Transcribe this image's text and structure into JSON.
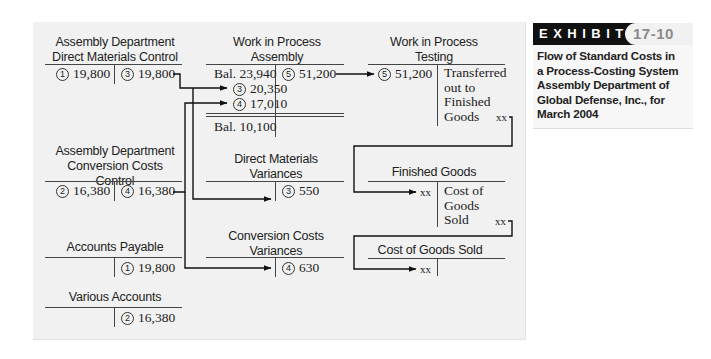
{
  "exhibit": {
    "label": "EXHIBIT",
    "number": "17-10",
    "caption": "Flow of Standard Costs in a Process-Costing System Assembly Department of Global Defense, Inc., for March 2004",
    "caption_lines": [
      "Flow of Standard Costs in",
      "a Process-Costing System",
      "Assembly Department of",
      "Global Defense, Inc., for",
      "March 2004"
    ]
  },
  "accounts": {
    "dm_control": {
      "title_lines": [
        "Assembly Department",
        "Direct Materials Control"
      ],
      "debit": {
        "marker": "1",
        "amount": "19,800"
      },
      "credit": {
        "marker": "3",
        "amount": "19,800"
      }
    },
    "cc_control": {
      "title_lines": [
        "Assembly Department",
        "Conversion Costs",
        "Control"
      ],
      "debit": {
        "marker": "2",
        "amount": "16,380"
      },
      "credit": {
        "marker": "4",
        "amount": "16,380"
      }
    },
    "accounts_payable": {
      "title": "Accounts Payable",
      "credit": {
        "marker": "1",
        "amount": "19,800"
      }
    },
    "various_accounts": {
      "title": "Various Accounts",
      "credit": {
        "marker": "2",
        "amount": "16,380"
      }
    },
    "wip_assembly": {
      "title_lines": [
        "Work in Process",
        "Assembly"
      ],
      "debit_beginning": "Bal. 23,940",
      "debit_entries": [
        {
          "marker": "3",
          "amount": "20,350"
        },
        {
          "marker": "4",
          "amount": "17,010"
        }
      ],
      "credit": {
        "marker": "5",
        "amount": "51,200"
      },
      "ending_balance": "Bal. 10,100"
    },
    "dm_variances": {
      "title_lines": [
        "Direct Materials",
        "Variances"
      ],
      "credit": {
        "marker": "3",
        "amount": "550"
      }
    },
    "cc_variances": {
      "title_lines": [
        "Conversion Costs",
        "Variances"
      ],
      "credit": {
        "marker": "4",
        "amount": "630"
      }
    },
    "wip_testing": {
      "title_lines": [
        "Work in Process",
        "Testing"
      ],
      "debit": {
        "marker": "5",
        "amount": "51,200"
      },
      "credit_text_lines": [
        "Transferred",
        "out to",
        "Finished",
        "Goods"
      ],
      "credit_amount": "xx"
    },
    "finished_goods": {
      "title": "Finished Goods",
      "debit_amount": "xx",
      "credit_text_lines": [
        "Cost of",
        "Goods",
        "Sold"
      ],
      "credit_amount": "xx"
    },
    "cogs": {
      "title": "Cost of Goods Sold",
      "debit_amount": "xx"
    }
  },
  "colors": {
    "panel_bg": "#f1f1f1",
    "line": "#222222",
    "exhibit_bar": "#111111",
    "exhibit_number": "#8a8a8a"
  }
}
